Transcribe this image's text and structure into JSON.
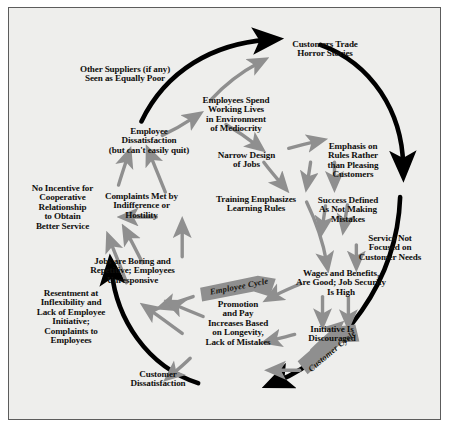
{
  "diagram": {
    "type": "causal-loop-diagram",
    "background_color": "#eeeeec",
    "border_color": "#5c5c5c",
    "outer_arrow_color": "#000000",
    "inner_arrow_color": "#8c8c8c",
    "banner_color": "#8f8f8f",
    "nodes": [
      {
        "id": "customers-trade-horror-stories",
        "label": "Customers Trade\nHorror Stories"
      },
      {
        "id": "other-suppliers-seen-as-equally-poor",
        "label": "Other Suppliers (if any)\nSeen as Equally Poor"
      },
      {
        "id": "employees-spend-working-lives",
        "label": "Employees Spend\nWorking Lives\nin Environment\nof Mediocrity"
      },
      {
        "id": "employee-dissatisfaction",
        "label": "Employee\nDissatisfaction\n(but can't easily quit)"
      },
      {
        "id": "narrow-design-of-jobs",
        "label": "Narrow Design\nof Jobs"
      },
      {
        "id": "emphasis-on-rules",
        "label": "Emphasis on\nRules Rather\nthan Pleasing\nCustomers"
      },
      {
        "id": "no-incentive-for-cooperative-relationship",
        "label": "No Incentive for\nCooperative\nRelationship\nto Obtain\nBetter Service"
      },
      {
        "id": "complaints-met-by-indifference",
        "label": "Complaints Met by\nIndifference or\nHostility"
      },
      {
        "id": "training-emphasizes-learning-rules",
        "label": "Training Emphasizes\nLearning Rules"
      },
      {
        "id": "success-defined-as-not-making-mistakes",
        "label": "Success Defined\nAs Not Making\nMistakes"
      },
      {
        "id": "service-not-focused-on-customer-needs",
        "label": "Service Not\nFocused on\nCustomer Needs"
      },
      {
        "id": "jobs-are-boring-and-repetitive",
        "label": "Jobs are Boring and\nRepetitive; Employees\nUnresponsive"
      },
      {
        "id": "wages-and-benefits-are-good",
        "label": "Wages and Benefits,\nAre Good; Job Security\nIs High"
      },
      {
        "id": "resentment-at-inflexibility",
        "label": "Resentment at\nInflexibility and\nLack of Employee\nInitiative;\nComplaints to\nEmployees"
      },
      {
        "id": "promotion-and-pay-increases",
        "label": "Promotion\nand Pay\nIncreases Based\non Longevity,\nLack of Mistakes"
      },
      {
        "id": "initiative-is-discouraged",
        "label": "Initiative Is\nDiscouraged"
      },
      {
        "id": "customer-dissatisfaction",
        "label": "Customer\nDissatisfaction"
      }
    ],
    "cycle_banners": [
      {
        "id": "employee-cycle",
        "label": "Employee Cycle"
      },
      {
        "id": "customer-cycle",
        "label": "Customer Cycle"
      }
    ]
  }
}
